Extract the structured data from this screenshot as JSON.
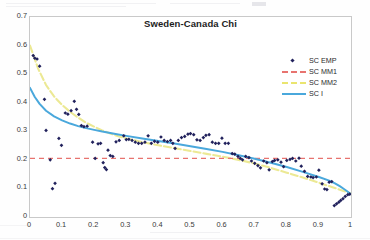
{
  "chart_data": {
    "type": "scatter",
    "title": "Sweden-Canada Chi",
    "xlabel": "",
    "ylabel": "",
    "xlim": [
      0,
      1
    ],
    "ylim": [
      0,
      0.7
    ],
    "grid": false,
    "legend_position": "upper-right",
    "xticks": [
      "0",
      "0.1",
      "0.2",
      "0.3",
      "0.4",
      "0.5",
      "0.6",
      "0.7",
      "0.8",
      "0.9",
      "1"
    ],
    "yticks": [
      "0",
      "0.1",
      "0.2",
      "0.3",
      "0.4",
      "0.5",
      "0.6",
      "0.7"
    ],
    "series": [
      {
        "name": "SC EMP",
        "type": "scatter",
        "marker": "diamond",
        "color": "#21215c",
        "points": [
          [
            0.01,
            0.565
          ],
          [
            0.015,
            0.556
          ],
          [
            0.022,
            0.553
          ],
          [
            0.03,
            0.528
          ],
          [
            0.045,
            0.412
          ],
          [
            0.05,
            0.303
          ],
          [
            0.063,
            0.2
          ],
          [
            0.07,
            0.099
          ],
          [
            0.078,
            0.118
          ],
          [
            0.09,
            0.275
          ],
          [
            0.098,
            0.251
          ],
          [
            0.11,
            0.364
          ],
          [
            0.118,
            0.36
          ],
          [
            0.128,
            0.372
          ],
          [
            0.138,
            0.405
          ],
          [
            0.145,
            0.377
          ],
          [
            0.152,
            0.359
          ],
          [
            0.16,
            0.32
          ],
          [
            0.168,
            0.316
          ],
          [
            0.178,
            0.318
          ],
          [
            0.195,
            0.262
          ],
          [
            0.203,
            0.205
          ],
          [
            0.212,
            0.256
          ],
          [
            0.22,
            0.258
          ],
          [
            0.228,
            0.19
          ],
          [
            0.233,
            0.173
          ],
          [
            0.238,
            0.166
          ],
          [
            0.243,
            0.234
          ],
          [
            0.25,
            0.215
          ],
          [
            0.258,
            0.212
          ],
          [
            0.268,
            0.263
          ],
          [
            0.278,
            0.268
          ],
          [
            0.292,
            0.284
          ],
          [
            0.3,
            0.271
          ],
          [
            0.308,
            0.272
          ],
          [
            0.318,
            0.268
          ],
          [
            0.328,
            0.262
          ],
          [
            0.338,
            0.258
          ],
          [
            0.348,
            0.258
          ],
          [
            0.358,
            0.262
          ],
          [
            0.368,
            0.284
          ],
          [
            0.378,
            0.258
          ],
          [
            0.388,
            0.265
          ],
          [
            0.398,
            0.262
          ],
          [
            0.408,
            0.28
          ],
          [
            0.418,
            0.268
          ],
          [
            0.428,
            0.264
          ],
          [
            0.438,
            0.268
          ],
          [
            0.445,
            0.258
          ],
          [
            0.452,
            0.24
          ],
          [
            0.462,
            0.268
          ],
          [
            0.472,
            0.278
          ],
          [
            0.482,
            0.282
          ],
          [
            0.492,
            0.29
          ],
          [
            0.5,
            0.292
          ],
          [
            0.51,
            0.288
          ],
          [
            0.52,
            0.27
          ],
          [
            0.53,
            0.268
          ],
          [
            0.54,
            0.278
          ],
          [
            0.548,
            0.286
          ],
          [
            0.558,
            0.288
          ],
          [
            0.568,
            0.262
          ],
          [
            0.578,
            0.258
          ],
          [
            0.588,
            0.258
          ],
          [
            0.598,
            0.276
          ],
          [
            0.608,
            0.258
          ],
          [
            0.618,
            0.258
          ],
          [
            0.63,
            0.222
          ],
          [
            0.638,
            0.22
          ],
          [
            0.648,
            0.212
          ],
          [
            0.655,
            0.205
          ],
          [
            0.662,
            0.2
          ],
          [
            0.672,
            0.212
          ],
          [
            0.682,
            0.208
          ],
          [
            0.69,
            0.196
          ],
          [
            0.7,
            0.188
          ],
          [
            0.71,
            0.18
          ],
          [
            0.718,
            0.172
          ],
          [
            0.728,
            0.196
          ],
          [
            0.738,
            0.19
          ],
          [
            0.745,
            0.165
          ],
          [
            0.755,
            0.194
          ],
          [
            0.762,
            0.198
          ],
          [
            0.772,
            0.2
          ],
          [
            0.782,
            0.192
          ],
          [
            0.79,
            0.176
          ],
          [
            0.8,
            0.198
          ],
          [
            0.81,
            0.202
          ],
          [
            0.818,
            0.205
          ],
          [
            0.828,
            0.196
          ],
          [
            0.838,
            0.206
          ],
          [
            0.845,
            0.178
          ],
          [
            0.855,
            0.16
          ],
          [
            0.865,
            0.142
          ],
          [
            0.875,
            0.14
          ],
          [
            0.882,
            0.138
          ],
          [
            0.892,
            0.14
          ],
          [
            0.9,
            0.164
          ],
          [
            0.91,
            0.116
          ],
          [
            0.918,
            0.098
          ],
          [
            0.925,
            0.096
          ],
          [
            0.932,
            0.122
          ],
          [
            0.94,
            0.124
          ],
          [
            0.948,
            0.04
          ],
          [
            0.955,
            0.046
          ],
          [
            0.962,
            0.052
          ],
          [
            0.968,
            0.058
          ],
          [
            0.975,
            0.064
          ],
          [
            0.982,
            0.072
          ],
          [
            0.99,
            0.078
          ],
          [
            0.996,
            0.08
          ]
        ]
      },
      {
        "name": "SC MM1",
        "type": "line",
        "style": "dashed",
        "color": "#e8736f",
        "constant": 0.205,
        "points": [
          [
            0.0,
            0.205
          ],
          [
            1.0,
            0.205
          ]
        ]
      },
      {
        "name": "SC MM2",
        "type": "line",
        "style": "dashed",
        "color": "#f2f0a0",
        "points": [
          [
            0.0,
            0.6
          ],
          [
            0.025,
            0.52
          ],
          [
            0.05,
            0.462
          ],
          [
            0.075,
            0.422
          ],
          [
            0.1,
            0.392
          ],
          [
            0.125,
            0.368
          ],
          [
            0.15,
            0.348
          ],
          [
            0.175,
            0.33
          ],
          [
            0.2,
            0.316
          ],
          [
            0.225,
            0.303
          ],
          [
            0.25,
            0.292
          ],
          [
            0.275,
            0.283
          ],
          [
            0.3,
            0.275
          ],
          [
            0.35,
            0.262
          ],
          [
            0.4,
            0.251
          ],
          [
            0.45,
            0.241
          ],
          [
            0.5,
            0.231
          ],
          [
            0.55,
            0.221
          ],
          [
            0.6,
            0.211
          ],
          [
            0.65,
            0.2
          ],
          [
            0.7,
            0.187
          ],
          [
            0.75,
            0.172
          ],
          [
            0.8,
            0.155
          ],
          [
            0.85,
            0.138
          ],
          [
            0.9,
            0.12
          ],
          [
            0.94,
            0.105
          ],
          [
            0.97,
            0.094
          ],
          [
            1.0,
            0.082
          ]
        ]
      },
      {
        "name": "SC I",
        "type": "line",
        "style": "solid",
        "color": "#4aa8dc",
        "points": [
          [
            0.0,
            0.452
          ],
          [
            0.015,
            0.42
          ],
          [
            0.03,
            0.396
          ],
          [
            0.05,
            0.372
          ],
          [
            0.075,
            0.352
          ],
          [
            0.1,
            0.338
          ],
          [
            0.125,
            0.327
          ],
          [
            0.15,
            0.318
          ],
          [
            0.175,
            0.311
          ],
          [
            0.2,
            0.305
          ],
          [
            0.225,
            0.299
          ],
          [
            0.25,
            0.294
          ],
          [
            0.275,
            0.289
          ],
          [
            0.3,
            0.284
          ],
          [
            0.35,
            0.275
          ],
          [
            0.4,
            0.266
          ],
          [
            0.45,
            0.257
          ],
          [
            0.5,
            0.248
          ],
          [
            0.55,
            0.238
          ],
          [
            0.6,
            0.228
          ],
          [
            0.65,
            0.216
          ],
          [
            0.7,
            0.204
          ],
          [
            0.75,
            0.19
          ],
          [
            0.8,
            0.175
          ],
          [
            0.85,
            0.158
          ],
          [
            0.9,
            0.14
          ],
          [
            0.93,
            0.128
          ],
          [
            0.95,
            0.118
          ],
          [
            0.965,
            0.108
          ],
          [
            0.978,
            0.098
          ],
          [
            0.988,
            0.09
          ],
          [
            1.0,
            0.08
          ]
        ]
      }
    ]
  },
  "legend": {
    "items": [
      {
        "label": "SC EMP",
        "key": "diamond-marker",
        "color": "#21215c"
      },
      {
        "label": "SC MM1",
        "key": "dashed-line",
        "color": "#e8736f"
      },
      {
        "label": "SC MM2",
        "key": "dashed-line",
        "color": "#eae56f"
      },
      {
        "label": "SC I",
        "key": "solid-line",
        "color": "#4aa8dc"
      }
    ]
  },
  "colors": {
    "marker": "#21215c",
    "mm1": "#e8736f",
    "mm2": "#ece994",
    "sci": "#4aa8dc",
    "frame": "#c9c9c9",
    "text": "#2b2b2b"
  }
}
